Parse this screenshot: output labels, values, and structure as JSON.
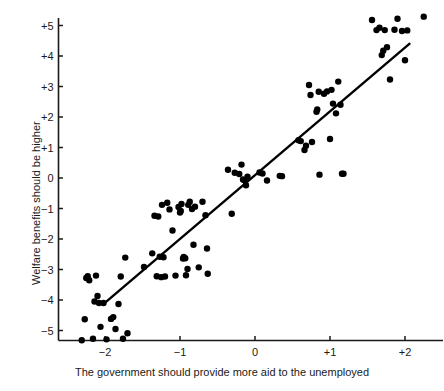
{
  "chart_data": {
    "type": "scatter",
    "title": "",
    "xlabel": "The government should provide more aid to the unemployed",
    "ylabel": "Welfare benefits should be higher",
    "xlim": [
      -2.45,
      2.4
    ],
    "ylim": [
      -5.7,
      5.6
    ],
    "xticks": [
      -2,
      -1,
      0,
      1,
      2
    ],
    "xtick_labels": [
      "−2",
      "−1",
      "0",
      "+1",
      "+2"
    ],
    "yticks": [
      -5,
      -4,
      -3,
      -2,
      -1,
      0,
      1,
      2,
      3,
      4,
      5
    ],
    "ytick_labels": [
      "−5",
      "−4",
      "−3",
      "−2",
      "−1",
      "0",
      "+1",
      "+2",
      "+3",
      "+4",
      "+5"
    ],
    "grid": false,
    "legend": "none",
    "marker": "filled-circle",
    "marker_color": "#000000",
    "marker_size": 3.2,
    "axis_color": "#1a1a1a",
    "background_color": "#ffffff",
    "fit_line": {
      "type": "linear-regression",
      "color": "#000000",
      "width": 2.4,
      "x_start": -2.03,
      "y_start": -4.15,
      "x_end": 2.07,
      "y_end": 4.42
    },
    "points": [
      {
        "x": -2.31,
        "y": -5.32
      },
      {
        "x": -2.27,
        "y": -4.63
      },
      {
        "x": -2.25,
        "y": -3.28
      },
      {
        "x": -2.23,
        "y": -3.22
      },
      {
        "x": -2.21,
        "y": -3.35
      },
      {
        "x": -2.16,
        "y": -5.27
      },
      {
        "x": -2.14,
        "y": -4.05
      },
      {
        "x": -2.12,
        "y": -3.2
      },
      {
        "x": -2.1,
        "y": -3.87
      },
      {
        "x": -2.08,
        "y": -4.1
      },
      {
        "x": -2.06,
        "y": -4.88
      },
      {
        "x": -2.02,
        "y": -4.1
      },
      {
        "x": -1.98,
        "y": -5.29
      },
      {
        "x": -1.92,
        "y": -4.62
      },
      {
        "x": -1.89,
        "y": -4.56
      },
      {
        "x": -1.86,
        "y": -4.95
      },
      {
        "x": -1.82,
        "y": -4.13
      },
      {
        "x": -1.79,
        "y": -3.23
      },
      {
        "x": -1.76,
        "y": -5.27
      },
      {
        "x": -1.73,
        "y": -2.61
      },
      {
        "x": -1.7,
        "y": -5.09
      },
      {
        "x": -1.48,
        "y": -2.92
      },
      {
        "x": -1.37,
        "y": -2.47
      },
      {
        "x": -1.34,
        "y": -1.24
      },
      {
        "x": -1.31,
        "y": -3.22
      },
      {
        "x": -1.29,
        "y": -1.26
      },
      {
        "x": -1.27,
        "y": -2.58
      },
      {
        "x": -1.25,
        "y": -3.25
      },
      {
        "x": -1.24,
        "y": -0.88
      },
      {
        "x": -1.22,
        "y": -2.6
      },
      {
        "x": -1.2,
        "y": -3.23
      },
      {
        "x": -1.17,
        "y": -0.81
      },
      {
        "x": -1.14,
        "y": -1.03
      },
      {
        "x": -1.1,
        "y": -1.72
      },
      {
        "x": -1.06,
        "y": -3.2
      },
      {
        "x": -1.02,
        "y": -0.95
      },
      {
        "x": -1.0,
        "y": -1.13
      },
      {
        "x": -0.99,
        "y": -1.08
      },
      {
        "x": -0.98,
        "y": -0.85
      },
      {
        "x": -0.96,
        "y": -2.64
      },
      {
        "x": -0.95,
        "y": -2.59
      },
      {
        "x": -0.93,
        "y": -2.63
      },
      {
        "x": -0.92,
        "y": -3.19
      },
      {
        "x": -0.9,
        "y": -2.98
      },
      {
        "x": -0.89,
        "y": -0.88
      },
      {
        "x": -0.87,
        "y": -0.78
      },
      {
        "x": -0.84,
        "y": -1.02
      },
      {
        "x": -0.82,
        "y": -2.19
      },
      {
        "x": -0.8,
        "y": -0.94
      },
      {
        "x": -0.75,
        "y": -2.93
      },
      {
        "x": -0.7,
        "y": -0.78
      },
      {
        "x": -0.66,
        "y": -1.22
      },
      {
        "x": -0.64,
        "y": -2.31
      },
      {
        "x": -0.63,
        "y": -3.14
      },
      {
        "x": -0.36,
        "y": 0.27
      },
      {
        "x": -0.31,
        "y": -1.17
      },
      {
        "x": -0.27,
        "y": 0.17
      },
      {
        "x": -0.21,
        "y": 0.13
      },
      {
        "x": -0.18,
        "y": 0.44
      },
      {
        "x": -0.16,
        "y": -0.05
      },
      {
        "x": -0.14,
        "y": -0.07
      },
      {
        "x": -0.12,
        "y": -0.24
      },
      {
        "x": -0.1,
        "y": 0.04
      },
      {
        "x": 0.06,
        "y": 0.18
      },
      {
        "x": 0.1,
        "y": 0.15
      },
      {
        "x": 0.16,
        "y": -0.08
      },
      {
        "x": 0.33,
        "y": 0.07
      },
      {
        "x": 0.36,
        "y": 0.06
      },
      {
        "x": 0.58,
        "y": 1.24
      },
      {
        "x": 0.61,
        "y": 1.21
      },
      {
        "x": 0.66,
        "y": 0.92
      },
      {
        "x": 0.68,
        "y": 1.06
      },
      {
        "x": 0.72,
        "y": 3.05
      },
      {
        "x": 0.74,
        "y": 2.72
      },
      {
        "x": 0.76,
        "y": 1.18
      },
      {
        "x": 0.82,
        "y": 2.17
      },
      {
        "x": 0.83,
        "y": 2.25
      },
      {
        "x": 0.85,
        "y": 2.83
      },
      {
        "x": 0.86,
        "y": 0.11
      },
      {
        "x": 0.92,
        "y": 2.76
      },
      {
        "x": 0.96,
        "y": 2.84
      },
      {
        "x": 1.0,
        "y": 1.28
      },
      {
        "x": 1.02,
        "y": 2.89
      },
      {
        "x": 1.04,
        "y": 2.44
      },
      {
        "x": 1.08,
        "y": 2.12
      },
      {
        "x": 1.11,
        "y": 3.16
      },
      {
        "x": 1.14,
        "y": 2.4
      },
      {
        "x": 1.16,
        "y": 0.14
      },
      {
        "x": 1.18,
        "y": 0.14
      },
      {
        "x": 1.56,
        "y": 5.18
      },
      {
        "x": 1.62,
        "y": 4.85
      },
      {
        "x": 1.66,
        "y": 4.93
      },
      {
        "x": 1.69,
        "y": 4.03
      },
      {
        "x": 1.71,
        "y": 4.17
      },
      {
        "x": 1.73,
        "y": 4.85
      },
      {
        "x": 1.76,
        "y": 4.29
      },
      {
        "x": 1.8,
        "y": 3.23
      },
      {
        "x": 1.86,
        "y": 4.86
      },
      {
        "x": 1.9,
        "y": 5.22
      },
      {
        "x": 1.96,
        "y": 4.82
      },
      {
        "x": 2.0,
        "y": 3.86
      },
      {
        "x": 2.03,
        "y": 4.84
      },
      {
        "x": 2.25,
        "y": 5.29
      }
    ]
  }
}
